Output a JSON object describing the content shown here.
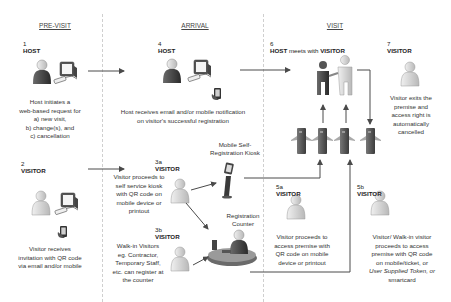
{
  "phases": {
    "pre_visit": "PRE-VISIT",
    "arrival": "ARRIVAL",
    "visit": "VISIT"
  },
  "steps": {
    "s1": {
      "num": "1",
      "role": "HOST",
      "desc": [
        "Host initiates a",
        "web-based request for",
        "a) new visit,",
        "b) change(s), and",
        "c) cancellation"
      ]
    },
    "s2": {
      "num": "2",
      "role": "VISITOR",
      "desc": [
        "Visitor receives",
        "invitation with QR code",
        "via email and/or mobile"
      ]
    },
    "s3a": {
      "num": "3a",
      "role": "VISITOR",
      "desc": [
        "Visitor proceeds to",
        "self service kiosk",
        "with QR code on",
        "mobile device or",
        "printout"
      ]
    },
    "s3b": {
      "num": "3b",
      "role": "VISITOR",
      "desc": [
        "Walk-in Visitors",
        "eg. Contractor,",
        "Temporary Staff,",
        "etc. can register at",
        "the counter"
      ]
    },
    "s4": {
      "num": "4",
      "role": "HOST",
      "desc": [
        "Host receives email and/or mobile notification",
        "on visitor's successful registration"
      ]
    },
    "s5a": {
      "num": "5a",
      "role": "VISITOR",
      "desc": [
        "Visitor proceeds to",
        "access premise with",
        "QR code on mobile",
        "device or printout"
      ]
    },
    "s5b": {
      "num": "5b",
      "role": "VISITOR",
      "desc": [
        "Visitor/ Walk-in visitor",
        "proceeds to access",
        "premise with QR code",
        "on mobile/ticket, or",
        "User Supplied Token, or",
        "smartcard"
      ]
    },
    "s6": {
      "num": "6",
      "role_host": "HOST",
      "meets": " meets with ",
      "role_visitor": "VISITOR"
    },
    "s7": {
      "num": "7",
      "role": "VISITOR",
      "desc": [
        "Visitor exits the",
        "premise and",
        "access right is",
        "automatically",
        "cancelled"
      ]
    }
  },
  "labels": {
    "kiosk": [
      "Mobile Self-",
      "Registration Kiosk"
    ],
    "counter": [
      "Registration",
      "Counter"
    ]
  },
  "icons": [
    "person-icon",
    "computer-icon",
    "mobile-phone-icon",
    "kiosk-icon",
    "registration-counter-icon",
    "handshake-icon",
    "turnstile-gate-icon",
    "arrow-icon"
  ],
  "colors": {
    "person_dark": "#3a3a3a",
    "person_light": "#d6d6d6",
    "line": "#4a4a4a",
    "divider": "#cfcfcf",
    "gate": "#5a5a5a"
  }
}
